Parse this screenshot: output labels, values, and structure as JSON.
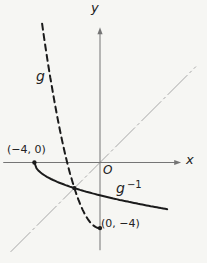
{
  "figure": {
    "background": "#f6f6f3",
    "axis_color": "#757575",
    "identity_line_color": "#a8a8a8",
    "curve_color": "#1b1b1b"
  },
  "labels": {
    "y_axis": "y",
    "x_axis": "x",
    "origin": "O",
    "g": "g",
    "g_inverse_base": "g",
    "g_inverse_sup": "−1",
    "point_left": "(−4, 0)",
    "point_bottom": "(0, −4)"
  },
  "chart_data": {
    "type": "line",
    "title": "",
    "xlabel": "x",
    "ylabel": "y",
    "origin_label": "O",
    "origin_px": {
      "x": 100,
      "y": 162.5
    },
    "unit_px": 16.4,
    "axes": {
      "x_range_units": [
        -5.9,
        4.95
      ],
      "y_range_units": [
        -5.35,
        8.25
      ],
      "grid": false
    },
    "curves": [
      {
        "id": "g",
        "label": "g",
        "equation": "y = x^2 - 4",
        "type": "quadratic",
        "a": 1,
        "b": 0,
        "c": -4,
        "domain": [
          -3.53,
          0
        ],
        "style": "dashed"
      },
      {
        "id": "g-inverse",
        "label": "g −1",
        "equation": "y = -sqrt(x + 4)",
        "type": "neg_sqrt",
        "shift": 4,
        "domain": [
          -4,
          4.1
        ],
        "style": "solid"
      }
    ],
    "identity_line": {
      "equation": "y = x",
      "domain": [
        -5.45,
        5.85
      ],
      "style": "dash-dot"
    },
    "points": [
      {
        "x": -4,
        "y": 0,
        "label": "(−4, 0)"
      },
      {
        "x": -1.5616,
        "y": -1.5616,
        "label": ""
      },
      {
        "x": 0,
        "y": -4,
        "label": "(0, −4)"
      }
    ]
  }
}
